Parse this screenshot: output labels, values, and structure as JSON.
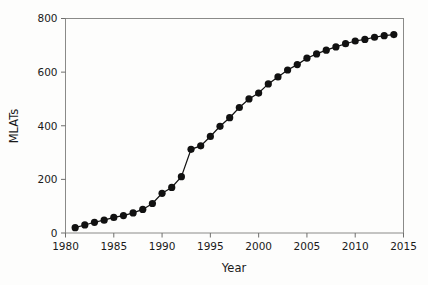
{
  "chart_data": {
    "type": "line",
    "title": "",
    "subtitle": "",
    "xlabel": "Year",
    "ylabel": "MLATs",
    "xlim": [
      1980,
      2015
    ],
    "ylim": [
      0,
      800
    ],
    "xticks": [
      1980,
      1985,
      1990,
      1995,
      2000,
      2005,
      2010,
      2015
    ],
    "yticks": [
      0,
      200,
      400,
      600,
      800
    ],
    "xtick_labels": [
      "1980",
      "1985",
      "1990",
      "1995",
      "2000",
      "2005",
      "2010",
      "2015"
    ],
    "ytick_labels": [
      "0",
      "200",
      "400",
      "600",
      "800"
    ],
    "grid": false,
    "legend": null,
    "legend_position": "none",
    "marker": "filled-circle",
    "marker_color": "#111111",
    "line_color": "#111111",
    "x": [
      1981,
      1982,
      1983,
      1984,
      1985,
      1986,
      1987,
      1988,
      1989,
      1990,
      1991,
      1992,
      1993,
      1994,
      1995,
      1996,
      1997,
      1998,
      1999,
      2000,
      2001,
      2002,
      2003,
      2004,
      2005,
      2006,
      2007,
      2008,
      2009,
      2010,
      2011,
      2012,
      2013,
      2014
    ],
    "values": [
      20,
      30,
      40,
      48,
      58,
      65,
      75,
      88,
      110,
      148,
      170,
      210,
      312,
      325,
      360,
      398,
      430,
      468,
      500,
      522,
      556,
      582,
      608,
      628,
      652,
      668,
      682,
      694,
      706,
      716,
      722,
      730,
      736,
      740
    ],
    "series": [
      {
        "name": "MLATs",
        "values": [
          20,
          30,
          40,
          48,
          58,
          65,
          75,
          88,
          110,
          148,
          170,
          210,
          312,
          325,
          360,
          398,
          430,
          468,
          500,
          522,
          556,
          582,
          608,
          628,
          652,
          668,
          682,
          694,
          706,
          716,
          722,
          730,
          736,
          740
        ]
      }
    ]
  },
  "axes": {
    "x_title": "Year",
    "y_title": "MLATs"
  }
}
